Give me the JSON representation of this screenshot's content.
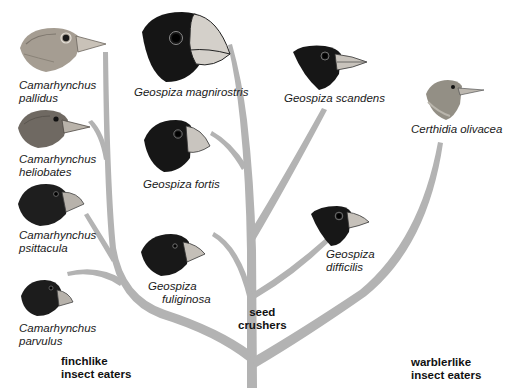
{
  "diagram": {
    "type": "phylogenetic-tree",
    "branch_color": "#b3b3b3",
    "groups": [
      {
        "id": "finchlike",
        "line1": "finchlike",
        "line2": "insect eaters"
      },
      {
        "id": "seed",
        "line1": "seed",
        "line2": "crushers"
      },
      {
        "id": "warblerlike",
        "line1": "warblerlike",
        "line2": "insect eaters"
      }
    ],
    "species": [
      {
        "id": "c-pallidus",
        "line1": "Camarhynchus",
        "line2": "pallidus",
        "group": "finchlike",
        "head_color": "#9a9288"
      },
      {
        "id": "c-heliobates",
        "line1": "Camarhynchus",
        "line2": "heliobates",
        "group": "finchlike",
        "head_color": "#6e6860"
      },
      {
        "id": "c-psittacula",
        "line1": "Camarhynchus",
        "line2": "psittacula",
        "group": "finchlike",
        "head_color": "#1e1e1e"
      },
      {
        "id": "c-parvulus",
        "line1": "Camarhynchus",
        "line2": "parvulus",
        "group": "finchlike",
        "head_color": "#1c1c1c"
      },
      {
        "id": "g-magnirostris",
        "line1": "Geospiza magnirostris",
        "group": "seed",
        "head_color": "#151515"
      },
      {
        "id": "g-fortis",
        "line1": "Geospiza fortis",
        "group": "seed",
        "head_color": "#161616"
      },
      {
        "id": "g-fuliginosa",
        "line1": "Geospiza",
        "line2": "fuliginosa",
        "group": "seed",
        "head_color": "#181818"
      },
      {
        "id": "g-scandens",
        "line1": "Geospiza scandens",
        "group": "seed",
        "head_color": "#161616"
      },
      {
        "id": "g-difficilis",
        "line1": "Geospiza",
        "line2": "difficilis",
        "group": "seed",
        "head_color": "#171717"
      },
      {
        "id": "c-olivacea",
        "line1": "Certhidia olivacea",
        "group": "warblerlike",
        "head_color": "#8f8c82"
      }
    ]
  }
}
